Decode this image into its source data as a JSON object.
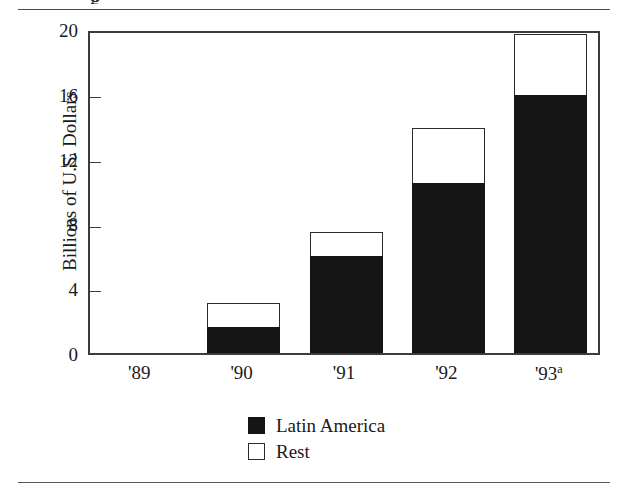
{
  "figure": {
    "title_clipped": "g",
    "y_axis_title": "Billions of U.S. Dollars"
  },
  "legend": {
    "entries": [
      {
        "label": "Latin America",
        "swatch": "filled-square-icon",
        "color": "#151515"
      },
      {
        "label": "Rest",
        "swatch": "hollow-square-icon",
        "color": "#ffffff"
      }
    ]
  },
  "chart_data": {
    "type": "bar",
    "stacked": true,
    "title": "",
    "xlabel": "",
    "ylabel": "Billions of U.S. Dollars",
    "categories": [
      "'89",
      "'90",
      "'91",
      "'92",
      "'93a"
    ],
    "category_labels": [
      {
        "text": "'89",
        "sup": ""
      },
      {
        "text": "'90",
        "sup": ""
      },
      {
        "text": "'91",
        "sup": ""
      },
      {
        "text": "'92",
        "sup": ""
      },
      {
        "text": "'93",
        "sup": "a"
      }
    ],
    "series": [
      {
        "name": "Latin America",
        "color": "#151515",
        "values": [
          0,
          1.6,
          6.0,
          10.5,
          15.9
        ]
      },
      {
        "name": "Rest",
        "color": "#ffffff",
        "values": [
          0,
          1.5,
          1.5,
          3.4,
          3.8
        ]
      }
    ],
    "totals": [
      0,
      3.1,
      7.5,
      13.9,
      19.7
    ],
    "ylim": [
      0,
      20
    ],
    "yticks": [
      0,
      4,
      8,
      12,
      16,
      20
    ],
    "ytick_labels": [
      "0",
      "4",
      "8",
      "12",
      "16",
      "20"
    ],
    "grid": false,
    "legend_position": "bottom-center"
  }
}
